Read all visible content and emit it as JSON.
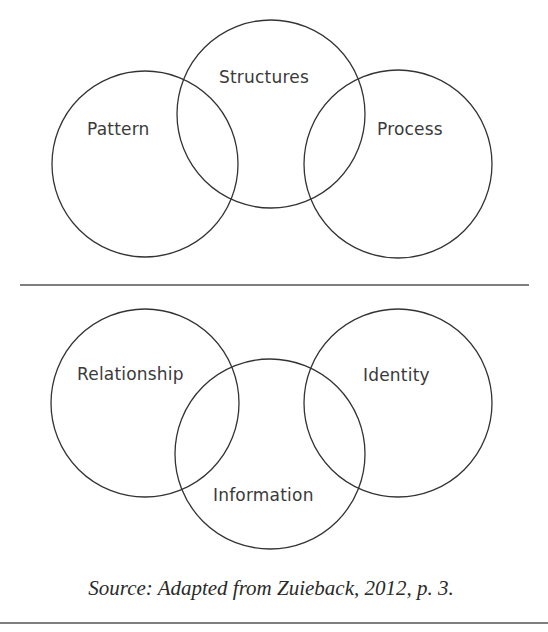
{
  "figure": {
    "top_diagram": {
      "labels": {
        "left": "Pattern",
        "top": "Structures",
        "right": "Process"
      }
    },
    "bottom_diagram": {
      "labels": {
        "left": "Relationship",
        "bottom": "Information",
        "right": "Identity"
      }
    },
    "caption": "Source: Adapted from Zuieback, 2012, p. 3."
  },
  "colors": {
    "stroke": "#333333",
    "text": "#3a3a3a",
    "background": "#ffffff"
  }
}
